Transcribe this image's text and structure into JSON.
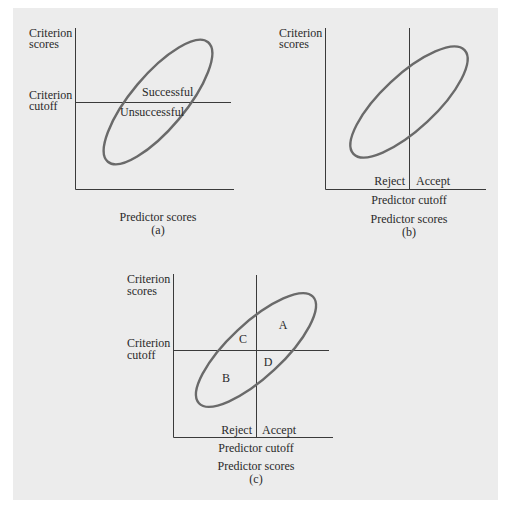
{
  "figure": {
    "background": "#ececec",
    "line_color": "#3a3a3a",
    "ellipse_color": "#6a6a6a",
    "panels": [
      {
        "id": "a",
        "caption": "(a)",
        "y_axis_label_line1": "Criterion",
        "y_axis_label_line2": "scores",
        "cutoff_label_line1": "Criterion",
        "cutoff_label_line2": "cutoff",
        "x_axis_label": "Predictor scores",
        "region_above": "Successful",
        "region_below": "Unsuccessful"
      },
      {
        "id": "b",
        "caption": "(b)",
        "y_axis_label_line1": "Criterion",
        "y_axis_label_line2": "scores",
        "left_label": "Reject",
        "right_label": "Accept",
        "cutoff_label": "Predictor cutoff",
        "x_axis_label": "Predictor scores"
      },
      {
        "id": "c",
        "caption": "(c)",
        "y_axis_label_line1": "Criterion",
        "y_axis_label_line2": "scores",
        "cutoff_label_line1": "Criterion",
        "cutoff_label_line2": "cutoff",
        "left_label": "Reject",
        "right_label": "Accept",
        "predictor_cutoff_label": "Predictor cutoff",
        "x_axis_label": "Predictor scores",
        "quadrants": {
          "top_right": "A",
          "bottom_left": "B",
          "top_left": "C",
          "bottom_right": "D"
        }
      }
    ]
  }
}
